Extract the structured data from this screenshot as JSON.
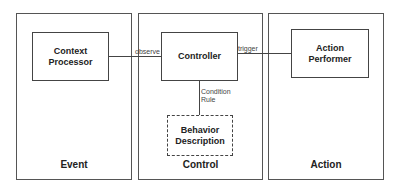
{
  "diagram": {
    "panels": [
      {
        "id": "event",
        "label": "Event"
      },
      {
        "id": "control",
        "label": "Control"
      },
      {
        "id": "action",
        "label": "Action"
      }
    ],
    "nodes": [
      {
        "id": "context_processor",
        "label": "Context\nProcessor",
        "panel": "event",
        "style": "solid"
      },
      {
        "id": "controller",
        "label": "Controller",
        "panel": "control",
        "style": "solid"
      },
      {
        "id": "behavior_description",
        "label": "Behavior\nDescription",
        "panel": "control",
        "style": "dashed"
      },
      {
        "id": "action_performer",
        "label": "Action\nPerformer",
        "panel": "action",
        "style": "solid"
      }
    ],
    "edges": [
      {
        "from": "context_processor",
        "to": "controller",
        "label": "observe"
      },
      {
        "from": "controller",
        "to": "action_performer",
        "label": "trigger"
      },
      {
        "from": "controller",
        "to": "behavior_description",
        "label": "Condition\nRule"
      }
    ],
    "colors": {
      "line": "#444444",
      "background": "#ffffff",
      "text": "#222222"
    }
  }
}
